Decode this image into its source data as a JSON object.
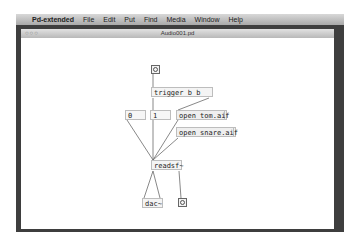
{
  "menubar": {
    "apple_icon": "",
    "app_name": "Pd-extended",
    "items": [
      "File",
      "Edit",
      "Put",
      "Find",
      "Media",
      "Window",
      "Help"
    ]
  },
  "window": {
    "title": "Audio001.pd",
    "traffic_lights": "○○○"
  },
  "patch": {
    "bang_in": "bang",
    "trigger": "trigger b b",
    "msg_zero": "0",
    "msg_one": "1",
    "msg_open_tom": "open tom.aif",
    "msg_open_snare": "open snare.aif",
    "readsf": "readsf~",
    "dac": "dac~",
    "bang_out": "bang"
  }
}
